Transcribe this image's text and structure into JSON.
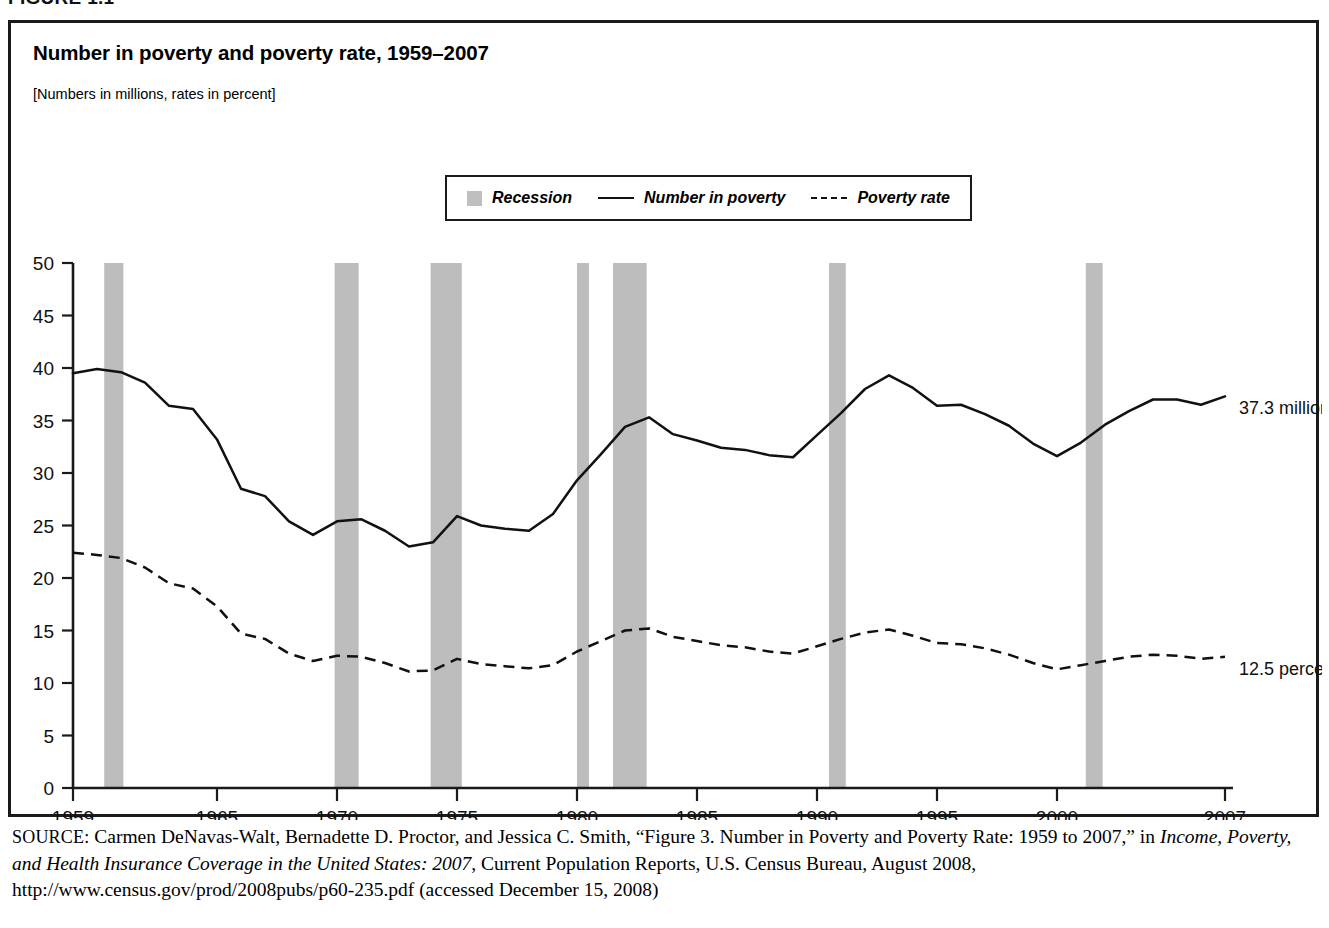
{
  "figure": {
    "label": "FIGURE 1.1",
    "title": "Number in poverty and poverty rate, 1959–2007",
    "subtitle": "[Numbers in millions, rates in percent]"
  },
  "legend": {
    "recession_label": "Recession",
    "number_label": "Number in poverty",
    "rate_label": "Poverty rate"
  },
  "annotations": {
    "number_end": "37.3 million",
    "rate_end": "12.5 percent"
  },
  "source": {
    "prefix": "SOURCE:",
    "text_1": " Carmen DeNavas-Walt, Bernadette D. Proctor, and Jessica C. Smith, “Figure 3. Number in Poverty and Poverty Rate: 1959 to 2007,” in ",
    "italic_1": "Income, Poverty, and Health Insurance Coverage in the United States: 2007",
    "text_2": ", Current Population Reports, U.S. Census Bureau, August 2008, http://www.census.gov/prod/2008pubs/p60-235.pdf (accessed December 15, 2008)"
  },
  "colors": {
    "recession_band": "#bdbdbd",
    "line": "#111111",
    "frame": "#1a1a1a",
    "background": "#ffffff"
  },
  "chart_data": {
    "type": "line",
    "title": "Number in poverty and poverty rate, 1959–2007",
    "subtitle": "[Numbers in millions, rates in percent]",
    "xlabel": "",
    "ylabel": "",
    "xlim": [
      1959,
      2007
    ],
    "ylim": [
      0,
      50
    ],
    "ytick_values": [
      0,
      5,
      10,
      15,
      20,
      25,
      30,
      35,
      40,
      45,
      50
    ],
    "xtick_values": [
      1959,
      1965,
      1970,
      1975,
      1980,
      1985,
      1990,
      1995,
      2000,
      2007
    ],
    "grid": false,
    "legend_position": "top-center",
    "x": [
      1959,
      1960,
      1961,
      1962,
      1963,
      1964,
      1965,
      1966,
      1967,
      1968,
      1969,
      1970,
      1971,
      1972,
      1973,
      1974,
      1975,
      1976,
      1977,
      1978,
      1979,
      1980,
      1981,
      1982,
      1983,
      1984,
      1985,
      1986,
      1987,
      1988,
      1989,
      1990,
      1991,
      1992,
      1993,
      1994,
      1995,
      1996,
      1997,
      1998,
      1999,
      2000,
      2001,
      2002,
      2003,
      2004,
      2005,
      2006,
      2007
    ],
    "series": [
      {
        "name": "Number in poverty",
        "units": "millions",
        "style": "solid",
        "end_label": "37.3 million",
        "values": [
          39.5,
          39.9,
          39.6,
          38.6,
          36.4,
          36.1,
          33.2,
          28.5,
          27.8,
          25.4,
          24.1,
          25.4,
          25.6,
          24.5,
          23.0,
          23.4,
          25.9,
          25.0,
          24.7,
          24.5,
          26.1,
          29.3,
          31.8,
          34.4,
          35.3,
          33.7,
          33.1,
          32.4,
          32.2,
          31.7,
          31.5,
          33.6,
          35.7,
          38.0,
          39.3,
          38.1,
          36.4,
          36.5,
          35.6,
          34.5,
          32.8,
          31.6,
          32.9,
          34.6,
          35.9,
          37.0,
          37.0,
          36.5,
          37.3
        ]
      },
      {
        "name": "Poverty rate",
        "units": "percent",
        "style": "dashed",
        "end_label": "12.5 percent",
        "values": [
          22.4,
          22.2,
          21.9,
          21.0,
          19.5,
          19.0,
          17.3,
          14.7,
          14.2,
          12.8,
          12.1,
          12.6,
          12.5,
          11.9,
          11.1,
          11.2,
          12.3,
          11.8,
          11.6,
          11.4,
          11.7,
          13.0,
          14.0,
          15.0,
          15.2,
          14.4,
          14.0,
          13.6,
          13.4,
          13.0,
          12.8,
          13.5,
          14.2,
          14.8,
          15.1,
          14.5,
          13.8,
          13.7,
          13.3,
          12.7,
          11.9,
          11.3,
          11.7,
          12.1,
          12.5,
          12.7,
          12.6,
          12.3,
          12.5
        ]
      }
    ],
    "recessions": [
      {
        "start": 1960.3,
        "end": 1961.1
      },
      {
        "start": 1969.9,
        "end": 1970.9
      },
      {
        "start": 1973.9,
        "end": 1975.2
      },
      {
        "start": 1980.0,
        "end": 1980.5
      },
      {
        "start": 1981.5,
        "end": 1982.9
      },
      {
        "start": 1990.5,
        "end": 1991.2
      },
      {
        "start": 2001.2,
        "end": 2001.9
      }
    ]
  }
}
